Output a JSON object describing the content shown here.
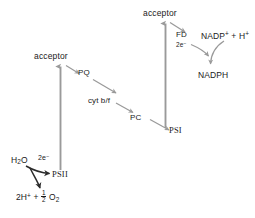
{
  "diagram": {
    "type": "flow-diagram",
    "background_color": "#ffffff",
    "arrow_color": "#9a9a9a",
    "text_color": "#1a1a1a",
    "labels": {
      "acceptor_psii": "acceptor",
      "acceptor_psi": "acceptor",
      "pq": "PQ",
      "cytbf": "cyt b/f",
      "pc": "PC",
      "psii": "PSII",
      "psi": "PSI",
      "fd": "FD",
      "water": "H",
      "water_sub": "2",
      "water_o": "O",
      "electrons_psii": "2e",
      "electrons_psii_sup": "−",
      "electrons_fd": "2e",
      "oxygen_lead": "2H",
      "oxygen_lead_sup": "+",
      "oxygen_plus": "+",
      "oxygen_frac_num": "1",
      "oxygen_frac_den": "2",
      "oxygen_o": "O",
      "oxygen_o_sub": "2",
      "nadp_base": "NADP",
      "nadp_sup": "+",
      "nadp_plus": " + H",
      "nadp_h_sup": "+",
      "nadph": "NADPH"
    }
  }
}
